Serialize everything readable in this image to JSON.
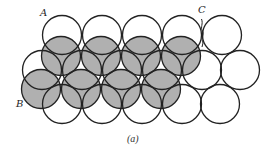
{
  "figure": {
    "caption": "(a)",
    "labels": {
      "A": "A",
      "B": "B",
      "C": "C"
    },
    "colors": {
      "background": "#ffffff",
      "stroke": "#222222",
      "open_fill": "#ffffff",
      "shaded_fill": "#b0b0b0"
    },
    "radius": 19.5,
    "bottom_layer": [
      {
        "cx": 62,
        "cy": 35
      },
      {
        "cx": 102,
        "cy": 35
      },
      {
        "cx": 142,
        "cy": 35
      },
      {
        "cx": 182,
        "cy": 35
      },
      {
        "cx": 222,
        "cy": 35
      },
      {
        "cx": 42,
        "cy": 70
      },
      {
        "cx": 82,
        "cy": 70
      },
      {
        "cx": 122,
        "cy": 70
      },
      {
        "cx": 162,
        "cy": 70
      },
      {
        "cx": 202,
        "cy": 70
      },
      {
        "cx": 240,
        "cy": 70
      },
      {
        "cx": 62,
        "cy": 104
      },
      {
        "cx": 102,
        "cy": 104
      },
      {
        "cx": 142,
        "cy": 104
      },
      {
        "cx": 182,
        "cy": 104
      },
      {
        "cx": 220,
        "cy": 104
      }
    ],
    "top_layer": [
      {
        "cx": 61,
        "cy": 56
      },
      {
        "cx": 101,
        "cy": 56
      },
      {
        "cx": 141,
        "cy": 56
      },
      {
        "cx": 181,
        "cy": 56
      },
      {
        "cx": 41,
        "cy": 89
      },
      {
        "cx": 81,
        "cy": 89
      },
      {
        "cx": 121,
        "cy": 89
      },
      {
        "cx": 161,
        "cy": 89
      }
    ]
  }
}
